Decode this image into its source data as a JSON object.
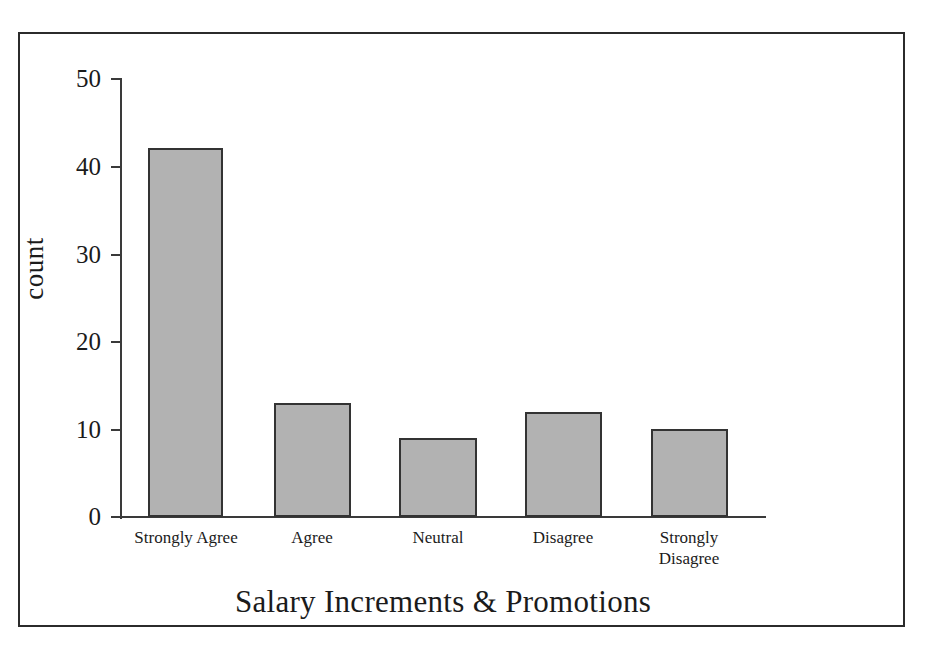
{
  "figure": {
    "top_remnant_text": "",
    "background_color": "#ffffff",
    "frame_color": "#2b2b2b",
    "bar_fill_color": "#b2b2b2",
    "bar_edge_color": "#333333",
    "axis_color": "#3a3a3a"
  },
  "chart_data": {
    "type": "bar",
    "title": "",
    "xlabel": "Salary Increments & Promotions",
    "ylabel": "count",
    "categories": [
      "Strongly Agree",
      "Agree",
      "Neutral",
      "Disagree",
      "Strongly Disagree"
    ],
    "category_lines": [
      [
        "Strongly Agree"
      ],
      [
        "Agree"
      ],
      [
        "Neutral"
      ],
      [
        "Disagree"
      ],
      [
        "Strongly",
        "Disagree"
      ]
    ],
    "values": [
      42,
      13,
      9,
      12,
      10
    ],
    "ylim": [
      0,
      50
    ],
    "yticks": [
      0,
      10,
      20,
      30,
      40,
      50
    ],
    "ytick_labels": [
      "0",
      "10",
      "20",
      "30",
      "40",
      "50"
    ],
    "grid": false,
    "legend": false,
    "total": 86
  }
}
